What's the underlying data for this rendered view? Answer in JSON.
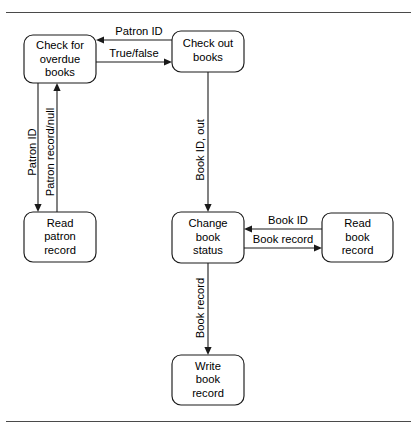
{
  "figure": {
    "type": "flow-diagram",
    "frame": {
      "top_rule": true,
      "bottom_rule": true,
      "rule_color": "#4a4a4a"
    },
    "nodes": [
      {
        "id": "check-overdue",
        "lines": [
          "Check for",
          "overdue",
          "books"
        ]
      },
      {
        "id": "check-out",
        "lines": [
          "Check out",
          "books"
        ]
      },
      {
        "id": "read-patron",
        "lines": [
          "Read",
          "patron",
          "record"
        ]
      },
      {
        "id": "change-status",
        "lines": [
          "Change",
          "book",
          "status"
        ]
      },
      {
        "id": "read-book",
        "lines": [
          "Read",
          "book",
          "record"
        ]
      },
      {
        "id": "write-book",
        "lines": [
          "Write",
          "book",
          "record"
        ]
      }
    ],
    "edges": [
      {
        "id": "e-patron-id-top",
        "label": "Patron ID",
        "from": "check-out",
        "to": "check-overdue",
        "orientation": "horizontal",
        "direction": "left"
      },
      {
        "id": "e-true-false",
        "label": "True/false",
        "from": "check-overdue",
        "to": "check-out",
        "orientation": "horizontal",
        "direction": "right"
      },
      {
        "id": "e-patron-id-down",
        "label": "Patron ID",
        "from": "check-overdue",
        "to": "read-patron",
        "orientation": "vertical",
        "direction": "down"
      },
      {
        "id": "e-patron-record",
        "label": "Patron record/null",
        "from": "read-patron",
        "to": "check-overdue",
        "orientation": "vertical",
        "direction": "up"
      },
      {
        "id": "e-book-id-out",
        "label": "Book ID, out",
        "from": "check-out",
        "to": "change-status",
        "orientation": "vertical",
        "direction": "down"
      },
      {
        "id": "e-book-id",
        "label": "Book ID",
        "from": "read-book",
        "to": "change-status",
        "orientation": "horizontal",
        "direction": "left"
      },
      {
        "id": "e-book-record-right",
        "label": "Book record",
        "from": "change-status",
        "to": "read-book",
        "orientation": "horizontal",
        "direction": "right"
      },
      {
        "id": "e-book-record-down",
        "label": "Book record",
        "from": "change-status",
        "to": "write-book",
        "orientation": "vertical",
        "direction": "down"
      }
    ]
  }
}
